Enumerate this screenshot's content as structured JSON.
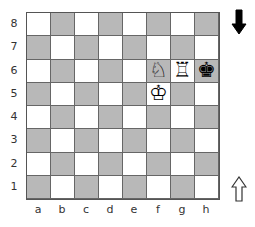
{
  "board": {
    "files": [
      "a",
      "b",
      "c",
      "d",
      "e",
      "f",
      "g",
      "h"
    ],
    "ranks": [
      "8",
      "7",
      "6",
      "5",
      "4",
      "3",
      "2",
      "1"
    ],
    "light_color": "#ffffff",
    "dark_color": "#b8b8b8",
    "pieces": [
      {
        "square": "f6",
        "piece": "white-knight",
        "glyph": "♘"
      },
      {
        "square": "g6",
        "piece": "white-rook",
        "glyph": "♖"
      },
      {
        "square": "h6",
        "piece": "black-king",
        "glyph": "♚"
      },
      {
        "square": "f5",
        "piece": "white-king",
        "glyph": "♔"
      }
    ]
  },
  "side_to_move_indicators": {
    "top": {
      "icon": "black-down-arrow",
      "color": "#000000"
    },
    "bottom": {
      "icon": "white-up-arrow",
      "color": "#ffffff"
    }
  }
}
